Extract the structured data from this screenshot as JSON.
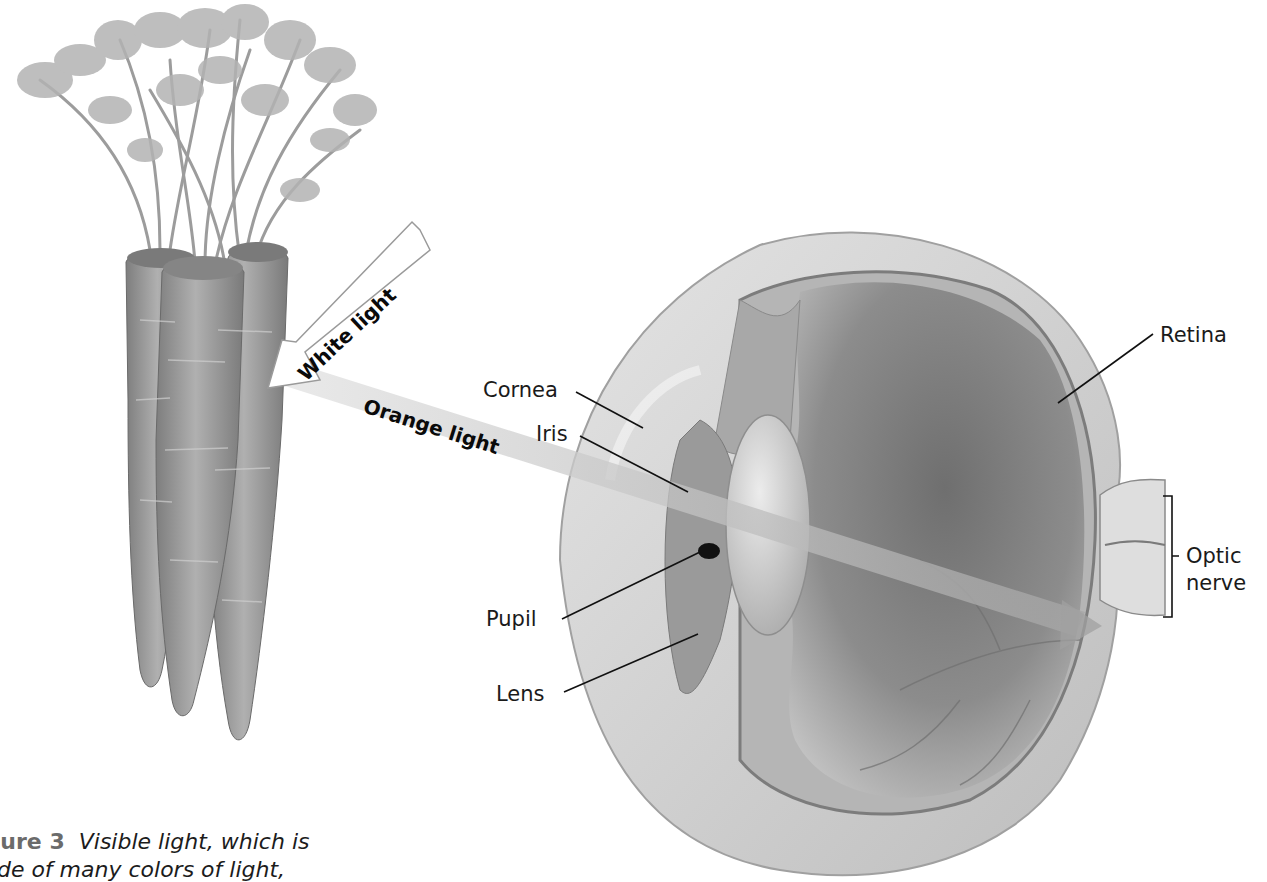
{
  "figure": {
    "number_label": "Figure 3",
    "caption_line1": "Visible light, which is",
    "caption_line2": "made of many colors of light,",
    "color_mode": "grayscale"
  },
  "beams": {
    "white_light": "White light",
    "orange_light": "Orange light"
  },
  "eye_labels": {
    "cornea": "Cornea",
    "iris": "Iris",
    "pupil": "Pupil",
    "lens": "Lens",
    "retina": "Retina",
    "optic_nerve_line1": "Optic",
    "optic_nerve_line2": "nerve"
  },
  "objects": {
    "carrots_count": 3,
    "subject": "carrots-and-eye-cross-section"
  },
  "colors": {
    "background": "#ffffff",
    "text": "#1a1a1a",
    "beam": "#b8b8b8",
    "sclera": "#d4d4d4",
    "vitreous": "#8a8a8a",
    "carrot": "#9a9a9a"
  }
}
